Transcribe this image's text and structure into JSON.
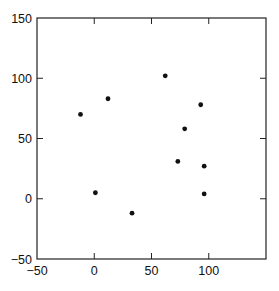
{
  "chart_data": {
    "type": "scatter",
    "title": "",
    "xlabel": "",
    "ylabel": "",
    "xlim": [
      -50,
      150
    ],
    "ylim": [
      -50,
      150
    ],
    "xticks": [
      -50,
      0,
      50,
      100
    ],
    "yticks": [
      -50,
      0,
      50,
      100,
      150
    ],
    "xtick_labels": [
      "-50",
      "0",
      "50",
      "100"
    ],
    "ytick_labels": [
      "-50",
      "0",
      "50",
      "100",
      "150"
    ],
    "grid": false,
    "legend": null,
    "series": [
      {
        "name": "points",
        "color": "#111111",
        "points": [
          {
            "x": -12,
            "y": 70
          },
          {
            "x": 12,
            "y": 83
          },
          {
            "x": 62,
            "y": 102
          },
          {
            "x": 93,
            "y": 78
          },
          {
            "x": 79,
            "y": 58
          },
          {
            "x": 73,
            "y": 31
          },
          {
            "x": 96,
            "y": 27
          },
          {
            "x": 96,
            "y": 4
          },
          {
            "x": 1,
            "y": 5
          },
          {
            "x": 33,
            "y": -12
          }
        ]
      }
    ]
  }
}
